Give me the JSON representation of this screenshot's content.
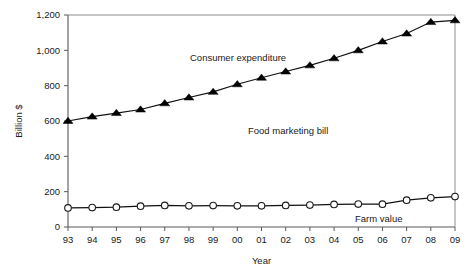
{
  "chart_data": {
    "type": "line",
    "title": "",
    "xlabel": "Year",
    "ylabel": "Billion $",
    "categories": [
      "93",
      "94",
      "95",
      "96",
      "97",
      "98",
      "99",
      "00",
      "01",
      "02",
      "03",
      "04",
      "05",
      "06",
      "07",
      "08",
      "09"
    ],
    "xlim": [
      0,
      16
    ],
    "ylim": [
      0,
      1200
    ],
    "ytick_labels": [
      "0",
      "200",
      "400",
      "600",
      "800",
      "1,000",
      "1,200"
    ],
    "ytick_values": [
      0,
      200,
      400,
      600,
      800,
      1000,
      1200
    ],
    "grid": false,
    "legend": "none",
    "series": [
      {
        "name": "Consumer expenditure",
        "marker": "filled-triangle",
        "color": "#000000",
        "values": [
          600,
          625,
          645,
          665,
          700,
          733,
          765,
          808,
          845,
          880,
          915,
          955,
          1000,
          1050,
          1095,
          1160,
          1170
        ]
      },
      {
        "name": "Farm value",
        "marker": "open-circle",
        "color": "#1a1a1a",
        "values": [
          108,
          110,
          112,
          118,
          122,
          120,
          121,
          120,
          120,
          122,
          124,
          128,
          130,
          129,
          152,
          165,
          172
        ]
      }
    ],
    "annotations": [
      {
        "text": "Consumer expenditure",
        "x_pixel": 190,
        "y_pixel": 61
      },
      {
        "text": "Food marketing bill",
        "x_pixel": 248,
        "y_pixel": 134
      },
      {
        "text": "Farm value",
        "x_pixel": 355,
        "y_pixel": 222
      }
    ]
  }
}
